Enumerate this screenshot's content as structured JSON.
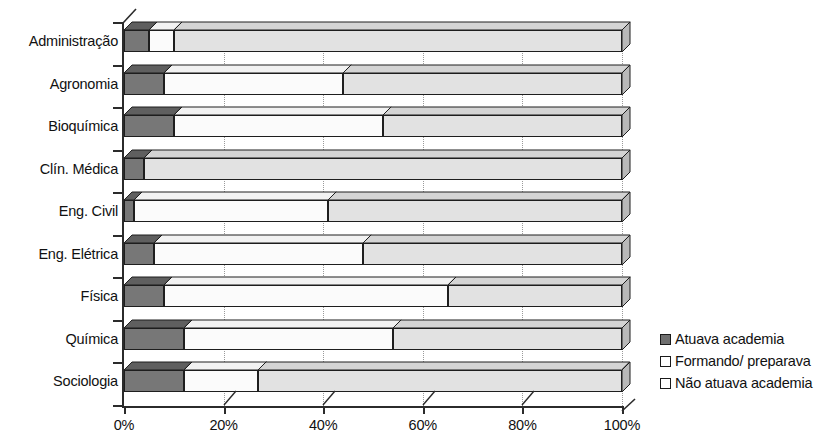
{
  "chart_data": {
    "type": "bar",
    "orientation": "horizontal",
    "stacked": true,
    "stack_mode": "percent",
    "title": "",
    "subtitle": "",
    "xlabel": "",
    "ylabel": "",
    "xlim": [
      0,
      100
    ],
    "xticks": [
      0,
      20,
      40,
      60,
      80,
      100
    ],
    "xticklabels": [
      "0%",
      "20%",
      "40%",
      "60%",
      "80%",
      "100%"
    ],
    "grid": "vertical-dotted",
    "legend_position": "right",
    "categories": [
      "Administração",
      "Agronomia",
      "Bioquímica",
      "Clín. Médica",
      "Eng. Civil",
      "Eng. Elétrica",
      "Física",
      "Química",
      "Sociologia"
    ],
    "series": [
      {
        "name": "Atuava academia",
        "color": "#777777",
        "values": [
          5,
          8,
          10,
          4,
          2,
          6,
          8,
          12,
          12
        ]
      },
      {
        "name": "Formando/ preparava",
        "color": "#fbfbfb",
        "values": [
          5,
          36,
          42,
          0,
          39,
          42,
          57,
          42,
          15
        ]
      },
      {
        "name": "Não atuava academia",
        "color": "#e2e2e2",
        "values": [
          90,
          56,
          48,
          96,
          59,
          52,
          35,
          46,
          73
        ]
      }
    ]
  },
  "legend": {
    "items": [
      {
        "label": "Atuava academia",
        "swatch": "filled-dark-square-icon"
      },
      {
        "label": "Formando/ preparava",
        "swatch": "empty-square-icon"
      },
      {
        "label": "Não atuava academia",
        "swatch": "empty-square-icon"
      }
    ]
  },
  "axes": {
    "x_tick_labels": [
      "0%",
      "20%",
      "40%",
      "60%",
      "80%",
      "100%"
    ],
    "y_tick_labels": [
      "Administração",
      "Agronomia",
      "Bioquímica",
      "Clín. Médica",
      "Eng. Civil",
      "Eng. Elétrica",
      "Física",
      "Química",
      "Sociologia"
    ]
  }
}
